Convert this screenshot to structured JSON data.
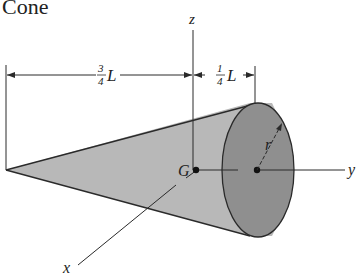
{
  "title": "Cone",
  "labels": {
    "z_axis": "z",
    "y_axis": "y",
    "x_axis": "x",
    "centroid": "G",
    "radius": "r",
    "dim_left_num": "3",
    "dim_left_den": "4",
    "dim_left_var": "L",
    "dim_right_num": "1",
    "dim_right_den": "4",
    "dim_right_var": "L"
  },
  "colors": {
    "cone_side": "#b8b8b8",
    "cone_base": "#8f8f8f",
    "line": "#2a2a2a"
  }
}
